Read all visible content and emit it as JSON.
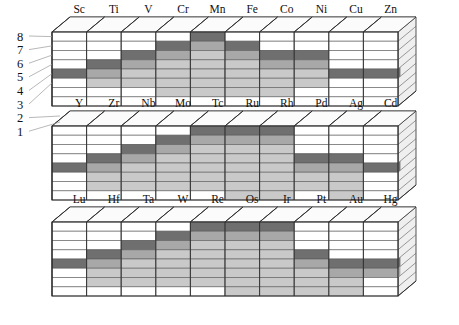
{
  "figure": {
    "type": "3d-block-diagram",
    "title": "",
    "axis_y": {
      "name": "level",
      "ticks": [
        "8",
        "7",
        "6",
        "5",
        "4",
        "3",
        "2",
        "1"
      ],
      "values": [
        8,
        7,
        6,
        5,
        4,
        3,
        2,
        1
      ],
      "count": 8
    },
    "shading": {
      "dark_band": "#6f6f6f",
      "mid_band": "#a8a8a8",
      "light_band": "#c9c9c9",
      "empty": "#ffffff",
      "outline": "#2b2b2b",
      "grid": "#5a5a5a",
      "top_face": "#fbfbfb",
      "side_face": "#efefef"
    },
    "rows": [
      {
        "series": "3d",
        "elements": [
          "Sc",
          "Ti",
          "V",
          "Cr",
          "Mn",
          "Fe",
          "Co",
          "Ni",
          "Cu",
          "Zn"
        ],
        "top_level": [
          4,
          5,
          6,
          7,
          8,
          7,
          6,
          6,
          4,
          4
        ],
        "fill_bottom": [
          4,
          3,
          3,
          2,
          2,
          2,
          2,
          3,
          4,
          4
        ]
      },
      {
        "series": "4d",
        "elements": [
          "Y",
          "Zr",
          "Nb",
          "Mo",
          "Tc",
          "Ru",
          "Rh",
          "Pd",
          "Ag",
          "Cd"
        ],
        "top_level": [
          4,
          5,
          6,
          7,
          8,
          8,
          8,
          5,
          5,
          4
        ],
        "fill_bottom": [
          4,
          2,
          2,
          2,
          2,
          1,
          1,
          2,
          1,
          4
        ]
      },
      {
        "series": "5d",
        "elements": [
          "Lu",
          "Hf",
          "Ta",
          "W",
          "Re",
          "Os",
          "Ir",
          "Pt",
          "Au",
          "Hg"
        ],
        "top_level": [
          4,
          5,
          6,
          7,
          8,
          8,
          8,
          5,
          4,
          4
        ],
        "fill_bottom": [
          4,
          2,
          2,
          2,
          2,
          1,
          1,
          1,
          1,
          3
        ]
      }
    ]
  }
}
